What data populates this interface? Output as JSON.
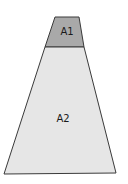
{
  "diagram": {
    "shape": "trapezoid",
    "regions": [
      {
        "id": "top",
        "label": "A1",
        "fill": "#a9a9a9"
      },
      {
        "id": "bottom",
        "label": "A2",
        "fill": "#e6e6e6"
      }
    ],
    "stroke": "#3a3a3a"
  }
}
